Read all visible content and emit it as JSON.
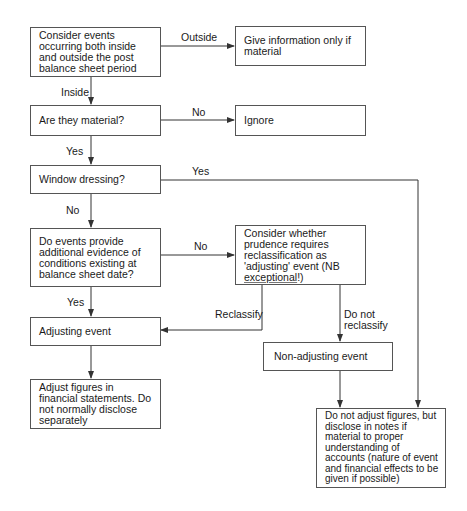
{
  "diagram": {
    "type": "flowchart",
    "nodes": {
      "consider_events": "Consider events occurring both inside and outside the post balance sheet period",
      "give_info": "Give information only if material",
      "are_material": "Are they material?",
      "ignore": "Ignore",
      "window_dressing": "Window dressing?",
      "additional_evidence": "Do events provide additional evidence of conditions existing at balance sheet date?",
      "consider_prudence_pre": "Consider whether prudence requires reclassification as 'adjusting' event (NB ",
      "consider_prudence_em": "exceptional",
      "consider_prudence_post": "!)",
      "adjusting_event": "Adjusting event",
      "non_adjusting_event": "Non-adjusting event",
      "adjust_figures": "Adjust figures in financial statements. Do not normally disclose separately",
      "do_not_adjust": "Do not adjust figures, but disclose in notes if material to proper understanding of accounts (nature of event and financial effects  to be given if possible)"
    },
    "edge_labels": {
      "outside": "Outside",
      "inside": "Inside",
      "no_material": "No",
      "yes_material": "Yes",
      "yes_window": "Yes",
      "no_window": "No",
      "no_evidence": "No",
      "yes_evidence": "Yes",
      "reclassify": "Reclassify",
      "do_not_reclassify_1": "Do not",
      "do_not_reclassify_2": "reclassify"
    },
    "line_color": "#333333"
  }
}
